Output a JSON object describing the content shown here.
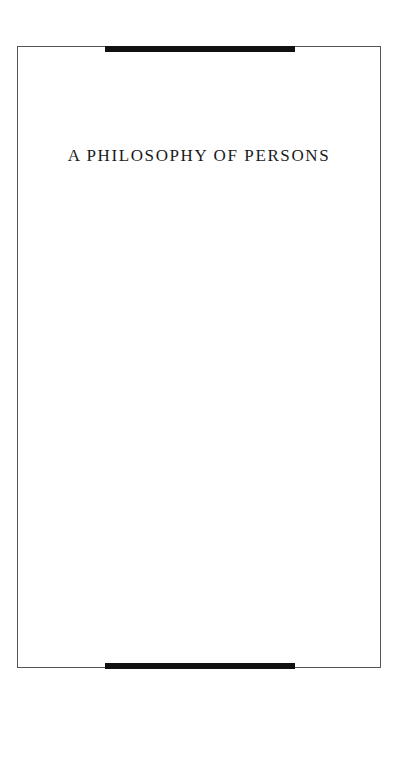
{
  "page": {
    "title": "A PHILOSOPHY OF PERSONS"
  },
  "colors": {
    "frame_border": "#555555",
    "rule_bar": "#111111",
    "title_text": "#1a1a1a",
    "background": "#ffffff"
  }
}
